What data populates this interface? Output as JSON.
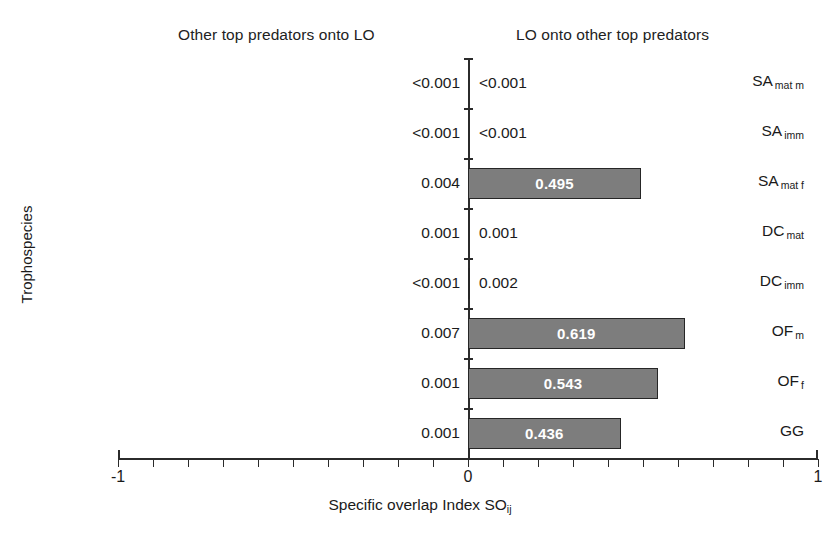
{
  "headers": {
    "left": "Other top predators onto LO",
    "right": "LO onto other top predators"
  },
  "axes": {
    "y_title": "Trophospecies",
    "x_title_main": "Specific overlap Index SO",
    "x_title_sub": "ij",
    "x_tick_labels": [
      "-1",
      "0",
      "1"
    ],
    "x_min": -1,
    "x_max": 1
  },
  "colors": {
    "bar_fill": "#7d7d7d",
    "bar_stroke": "#262626",
    "bar_label": "#ffffff",
    "axis": "#2b2b2b",
    "text": "#1a1a1a",
    "background": "#ffffff"
  },
  "chart_data": {
    "type": "bar",
    "title": "",
    "xlabel": "Specific overlap Index SOij",
    "ylabel": "Trophospecies",
    "xlim": [
      -1,
      1
    ],
    "grid": false,
    "legend": "none",
    "orientation": "horizontal-diverging",
    "x_ticks": [
      -1,
      0,
      1
    ],
    "x_minor_tick_step": 0.1,
    "categories": [
      "SA mat m",
      "SA imm",
      "SA mat f",
      "DC mat",
      "DC imm",
      "OF m",
      "OF f",
      "GG"
    ],
    "series": [
      {
        "name": "Other top predators onto LO",
        "direction": "left",
        "display_values": [
          "<0.001",
          "<0.001",
          "0.004",
          "0.001",
          "<0.001",
          "0.007",
          "0.001",
          "0.001"
        ],
        "values": [
          0.001,
          0.001,
          0.004,
          0.001,
          0.001,
          0.007,
          0.001,
          0.001
        ]
      },
      {
        "name": "LO onto other top predators",
        "direction": "right",
        "display_values": [
          "<0.001",
          "<0.001",
          "0.495",
          "0.001",
          "0.002",
          "0.619",
          "0.543",
          "0.436"
        ],
        "values": [
          0.001,
          0.001,
          0.495,
          0.001,
          0.002,
          0.619,
          0.543,
          0.436
        ]
      }
    ]
  },
  "rows": [
    {
      "label_main": "SA",
      "label_sub": "mat m",
      "left_value": "<0.001",
      "right_value": "<0.001",
      "right_numeric": 0.001,
      "bar_inside": false
    },
    {
      "label_main": "SA",
      "label_sub": "imm",
      "left_value": "<0.001",
      "right_value": "<0.001",
      "right_numeric": 0.001,
      "bar_inside": false
    },
    {
      "label_main": "SA",
      "label_sub": "mat f",
      "left_value": "0.004",
      "right_value": "0.495",
      "right_numeric": 0.495,
      "bar_inside": true
    },
    {
      "label_main": "DC",
      "label_sub": "mat",
      "left_value": "0.001",
      "right_value": "0.001",
      "right_numeric": 0.001,
      "bar_inside": false
    },
    {
      "label_main": "DC",
      "label_sub": "imm",
      "left_value": "<0.001",
      "right_value": "0.002",
      "right_numeric": 0.002,
      "bar_inside": false
    },
    {
      "label_main": "OF",
      "label_sub": "m",
      "left_value": "0.007",
      "right_value": "0.619",
      "right_numeric": 0.619,
      "bar_inside": true
    },
    {
      "label_main": "OF",
      "label_sub": "f",
      "left_value": "0.001",
      "right_value": "0.543",
      "right_numeric": 0.543,
      "bar_inside": true
    },
    {
      "label_main": "GG",
      "label_sub": "",
      "left_value": "0.001",
      "right_value": "0.436",
      "right_numeric": 0.436,
      "bar_inside": true
    }
  ]
}
